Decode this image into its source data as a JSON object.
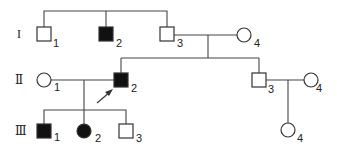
{
  "diagram": {
    "type": "pedigree",
    "generations": [
      {
        "label": "I",
        "y": 35
      },
      {
        "label": "Ⅱ",
        "y": 82
      },
      {
        "label": "Ⅲ",
        "y": 133
      }
    ],
    "individuals": [
      {
        "id": "I-1",
        "number": "1",
        "sex": "male",
        "affected": false,
        "x": 44,
        "y": 34
      },
      {
        "id": "I-2",
        "number": "2",
        "sex": "male",
        "affected": true,
        "x": 106,
        "y": 34
      },
      {
        "id": "I-3",
        "number": "3",
        "sex": "male",
        "affected": false,
        "x": 167,
        "y": 34
      },
      {
        "id": "I-4",
        "number": "4",
        "sex": "female",
        "affected": false,
        "x": 244,
        "y": 35
      },
      {
        "id": "II-1",
        "number": "1",
        "sex": "female",
        "affected": false,
        "x": 44,
        "y": 80
      },
      {
        "id": "II-2",
        "number": "2",
        "sex": "male",
        "affected": true,
        "proband": true,
        "x": 121,
        "y": 80
      },
      {
        "id": "II-3",
        "number": "3",
        "sex": "male",
        "affected": false,
        "x": 259,
        "y": 80
      },
      {
        "id": "II-4",
        "number": "4",
        "sex": "female",
        "affected": false,
        "x": 311,
        "y": 80
      },
      {
        "id": "III-1",
        "number": "1",
        "sex": "male",
        "affected": true,
        "x": 44,
        "y": 131
      },
      {
        "id": "III-2",
        "number": "2",
        "sex": "female",
        "affected": true,
        "x": 84,
        "y": 131
      },
      {
        "id": "III-3",
        "number": "3",
        "sex": "male",
        "affected": false,
        "x": 126,
        "y": 131
      },
      {
        "id": "III-4",
        "number": "4",
        "sex": "female",
        "affected": false,
        "x": 288,
        "y": 130
      }
    ],
    "colors": {
      "affected": "#111111",
      "unaffected": "#ffffff",
      "line": "#444444"
    }
  }
}
